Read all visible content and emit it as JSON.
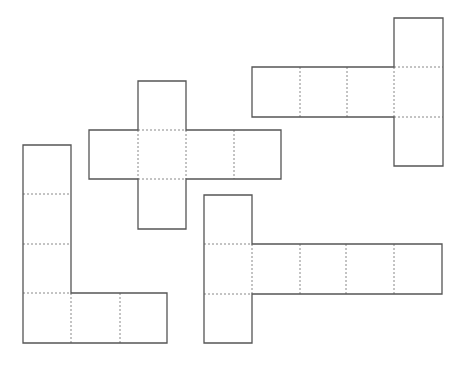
{
  "figure": {
    "width": 462,
    "height": 367,
    "background": "#ffffff",
    "stroke_color": "#555555",
    "dash_color": "#888888",
    "cell_size": 48
  },
  "nets": [
    {
      "id": "cross-net",
      "label": "cross-shaped cube net",
      "outline": [
        [
          138,
          81
        ],
        [
          186,
          81
        ],
        [
          186,
          130
        ],
        [
          281,
          130
        ],
        [
          281,
          179
        ],
        [
          186,
          179
        ],
        [
          186,
          229
        ],
        [
          138,
          229
        ],
        [
          138,
          179
        ],
        [
          89,
          179
        ],
        [
          89,
          130
        ],
        [
          138,
          130
        ]
      ],
      "folds": [
        [
          138,
          130,
          186,
          130
        ],
        [
          138,
          179,
          186,
          179
        ],
        [
          138,
          130,
          138,
          179
        ],
        [
          186,
          130,
          186,
          179
        ],
        [
          234,
          130,
          234,
          179
        ]
      ]
    },
    {
      "id": "t-net-top-right",
      "label": "T-shaped cube net (top right)",
      "outline": [
        [
          394,
          18
        ],
        [
          443,
          18
        ],
        [
          443,
          166
        ],
        [
          394,
          166
        ],
        [
          394,
          117
        ],
        [
          252,
          117
        ],
        [
          252,
          67
        ],
        [
          394,
          67
        ]
      ],
      "folds": [
        [
          300,
          67,
          300,
          117
        ],
        [
          347,
          67,
          347,
          117
        ],
        [
          394,
          67,
          394,
          117
        ],
        [
          394,
          67,
          443,
          67
        ],
        [
          394,
          117,
          443,
          117
        ]
      ]
    },
    {
      "id": "l-net",
      "label": "L-shaped cube net",
      "outline": [
        [
          23,
          145
        ],
        [
          71,
          145
        ],
        [
          71,
          293
        ],
        [
          167,
          293
        ],
        [
          167,
          343
        ],
        [
          23,
          343
        ]
      ],
      "folds": [
        [
          23,
          194,
          71,
          194
        ],
        [
          23,
          244,
          71,
          244
        ],
        [
          23,
          293,
          71,
          293
        ],
        [
          71,
          293,
          71,
          343
        ],
        [
          120,
          293,
          120,
          343
        ]
      ]
    },
    {
      "id": "t-net-bottom-right",
      "label": "T-shaped cube net (bottom right)",
      "outline": [
        [
          204,
          195
        ],
        [
          252,
          195
        ],
        [
          252,
          244
        ],
        [
          442,
          244
        ],
        [
          442,
          294
        ],
        [
          252,
          294
        ],
        [
          252,
          343
        ],
        [
          204,
          343
        ]
      ],
      "folds": [
        [
          204,
          244,
          252,
          244
        ],
        [
          204,
          294,
          252,
          294
        ],
        [
          252,
          244,
          252,
          294
        ],
        [
          300,
          244,
          300,
          294
        ],
        [
          346,
          244,
          346,
          294
        ],
        [
          394,
          244,
          394,
          294
        ]
      ]
    }
  ]
}
